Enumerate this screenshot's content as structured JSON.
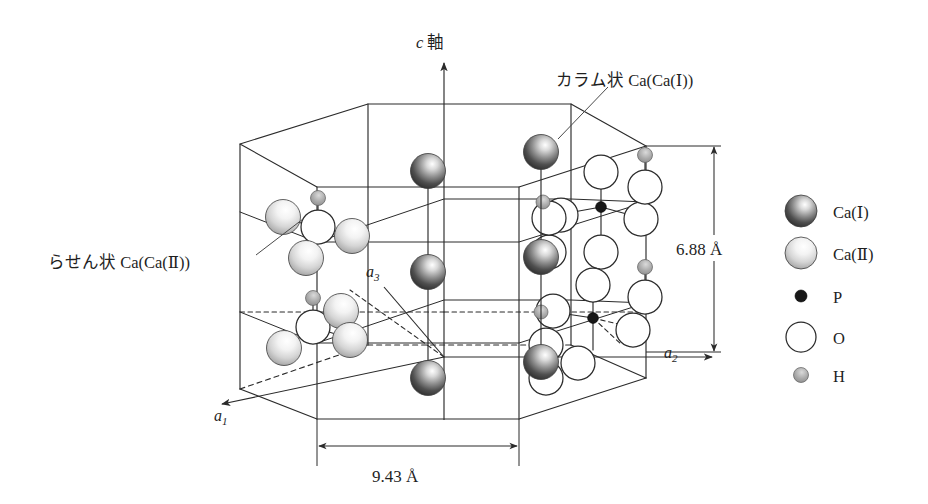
{
  "figure": {
    "background_color": "#ffffff",
    "line_color": "#2b2b2b"
  },
  "axes": {
    "c_axis": {
      "label": "c 軸",
      "italic_part": "c",
      "text_part": " 軸"
    },
    "a1": {
      "label": "a",
      "subscript": "1"
    },
    "a2": {
      "label": "a",
      "subscript": "2"
    },
    "a3": {
      "label": "a",
      "subscript": "3"
    }
  },
  "annotations": {
    "columnar": {
      "text": "カラム状 Ca(Ca(Ⅰ))",
      "description": "columnar calcium site one"
    },
    "helical": {
      "text": "らせん状 Ca(Ca(Ⅱ))",
      "description": "helical calcium site two"
    }
  },
  "dimensions": {
    "height": {
      "value": "6.88 Å",
      "orientation": "vertical",
      "axis": "c"
    },
    "width": {
      "value": "9.43 Å",
      "orientation": "horizontal",
      "axis": "a"
    }
  },
  "legend": {
    "items": [
      {
        "label": "Ca(Ⅰ)",
        "marker": "sphere-dark",
        "color": "#4a4a4a",
        "size": "large"
      },
      {
        "label": "Ca(Ⅱ)",
        "marker": "sphere-light",
        "color": "#d8d8d8",
        "size": "large"
      },
      {
        "label": "P",
        "marker": "dot-black",
        "color": "#181818",
        "size": "small"
      },
      {
        "label": "O",
        "marker": "circle-open",
        "color": "#ffffff",
        "size": "medium"
      },
      {
        "label": "H",
        "marker": "dot-gray",
        "color": "#9a9a9a",
        "size": "tiny"
      }
    ]
  },
  "structure": {
    "cell_type": "hexagonal prism",
    "ca1_columns": 3,
    "ca2_triangles": 2,
    "phosphate_groups": 2,
    "hydroxyl_columns": 2
  }
}
